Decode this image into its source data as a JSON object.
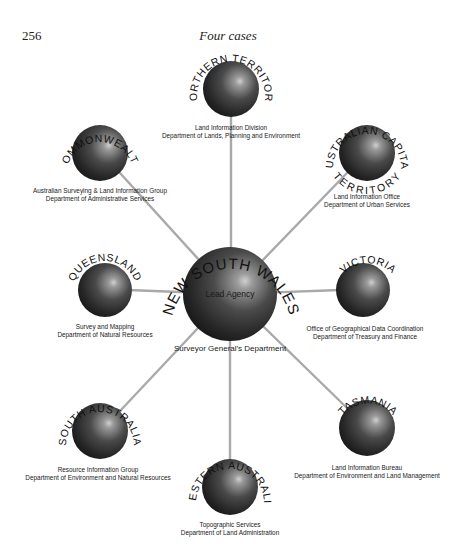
{
  "page": {
    "number": "256",
    "running_head": "Four cases"
  },
  "center": {
    "name": "NEW SOUTH WALES",
    "inner_label": "Lead Agency",
    "caption": "Surveyor General's Department"
  },
  "nodes": {
    "northern_territory": {
      "name": "NORTHERN TERRITORY",
      "line1": "Land Information Division",
      "line2": "Department of Lands, Planning and Environment"
    },
    "commonwealth": {
      "name": "COMMONWEALTH",
      "line1": "Australian Surveying & Land Information Group",
      "line2": "Department of Administrative Services"
    },
    "act": {
      "name_top": "AUSTRALIAN CAPITAL",
      "name_bottom": "TERRITORY",
      "line1": "Land Information Office",
      "line2": "Department of Urban Services"
    },
    "queensland": {
      "name": "QUEENSLAND",
      "line1": "Survey and Mapping",
      "line2": "Department of Natural Resources"
    },
    "victoria": {
      "name": "VICTORIA",
      "line1": "Office of Geographical Data Coordination",
      "line2": "Department of Treasury and Finance"
    },
    "south_australia": {
      "name": "SOUTH AUSTRALIA",
      "line1": "Resource Information Group",
      "line2": "Department of Environment and Natural Resources"
    },
    "tasmania": {
      "name": "TASMANIA",
      "line1": "Land Information Bureau",
      "line2": "Department of Environment and Land Management"
    },
    "western_australia": {
      "name": "WESTERN AUSTRALIA",
      "line1": "Topographic Services",
      "line2": "Department of Land Administration"
    }
  },
  "colors": {
    "connector": "#a9a9a9",
    "sphere_dark": "#1c1c1c",
    "sphere_light": "#c8c8c8"
  }
}
